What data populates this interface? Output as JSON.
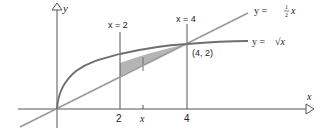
{
  "figure": {
    "colors": {
      "axis": "#555555",
      "curve": "#6e6e6e",
      "line": "#9a9a9a",
      "shade": "#b5b5b5",
      "text": "#222222"
    },
    "axes": {
      "x_label": "x",
      "y_label": "y",
      "x_ticks": [
        {
          "value": 2,
          "label": "2"
        },
        {
          "value": 4,
          "label": "4"
        }
      ],
      "x_variable_tick": {
        "label": "x"
      }
    },
    "curves": [
      {
        "name": "sqrt",
        "label_prefix": "y = ",
        "label_expr": "√x"
      },
      {
        "name": "half-line",
        "label_prefix": "y = ",
        "label_frac_num": "1",
        "label_frac_den": "2",
        "label_var": "x"
      }
    ],
    "vertical_lines": [
      {
        "label": "x = 2",
        "x": 2
      },
      {
        "label": "x = 4",
        "x": 4
      }
    ],
    "point": {
      "label": "(4, 2)",
      "x": 4,
      "y": 2
    },
    "shaded_region": {
      "from_x": 2,
      "to_x": 4,
      "between": [
        "y = √x",
        "y = ½x"
      ]
    }
  }
}
